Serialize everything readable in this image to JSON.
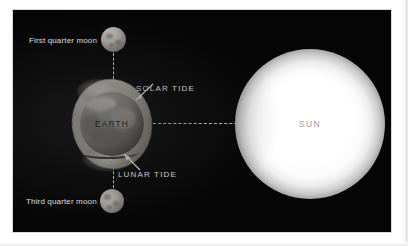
{
  "figure": {
    "background_color": "#ffffff",
    "plate_color": "#050505"
  },
  "bodies": {
    "earth": {
      "label": "EARTH",
      "label_color": "#1a1a1a",
      "description": "Earth shown with exaggerated tidal bulges"
    },
    "sun": {
      "label": "SUN",
      "label_color": "#9a9a9a",
      "description": "Bright glowing sun at right"
    },
    "moon_first_quarter": {
      "label": "First quarter moon",
      "label_color": "#f0f0f0"
    },
    "moon_third_quarter": {
      "label": "Third quarter moon",
      "label_color": "#f0f0f0"
    }
  },
  "callouts": {
    "solar_tide": {
      "label": "SOLAR TIDE",
      "label_color": "#f0f0f0"
    },
    "lunar_tide": {
      "label": "LUNAR TIDE",
      "label_color": "#f0f0f0"
    }
  },
  "connectors": {
    "moon_top_line": "dashed",
    "moon_bottom_line": "dashed",
    "earth_sun_line": "dashed",
    "line_color": "#d2d2d2"
  }
}
